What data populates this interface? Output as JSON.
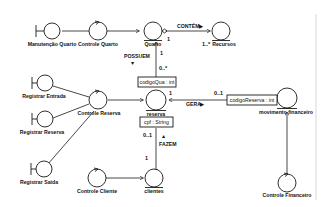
{
  "diagram": {
    "type": "UML robustness diagram",
    "colors": {
      "stroke": "#1a1a1a",
      "background": "#ffffff",
      "border_line": "#cccccc"
    },
    "boundaries": [
      {
        "id": "manutencao_quarto",
        "label": "Manutenção Quarto"
      },
      {
        "id": "registrar_entrada",
        "label": "Registrar Entrada"
      },
      {
        "id": "registrar_reserva",
        "label": "Registrar Reserva"
      },
      {
        "id": "registrar_saida",
        "label": "Registrar Saída"
      }
    ],
    "controls": [
      {
        "id": "controle_quarto",
        "label": "Controle Quarto"
      },
      {
        "id": "controle_reserva",
        "label": "Controle Reserva"
      },
      {
        "id": "controle_cliente",
        "label": "Controle Cliente"
      },
      {
        "id": "controle_financeiro",
        "label": "Controle Financeiro"
      }
    ],
    "entities": [
      {
        "id": "quarto",
        "label": "Quarto"
      },
      {
        "id": "recursos",
        "label": "Recursos"
      },
      {
        "id": "reserva",
        "label": "reserva"
      },
      {
        "id": "clientes",
        "label": "clientes"
      },
      {
        "id": "movimento_financeiro",
        "label": "movimento financeiro"
      }
    ],
    "qualifiers": {
      "codigo_qua": "codigoQua : int",
      "cpf": "cpf : String",
      "codigo_reserva": "codigoReserva : int"
    },
    "associations": {
      "contem": {
        "label": "CONTÉM",
        "direction": "▶",
        "mult_quarto": "1",
        "mult_recursos": "1..*"
      },
      "possuem": {
        "label": "POSSUEM",
        "direction": "▼",
        "mult_quarto": "1",
        "mult_reserva": "0..*"
      },
      "gera": {
        "label": "GERA",
        "direction": "▶",
        "mult_reserva": "1",
        "mult_movimento": "0..1"
      },
      "fazem": {
        "label": "FAZEM",
        "direction": "▲",
        "mult_reserva": "0..1",
        "mult_clientes": "1"
      }
    }
  }
}
